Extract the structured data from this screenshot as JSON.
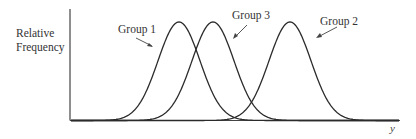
{
  "chart_data": {
    "type": "line",
    "title": "",
    "xlabel": "y",
    "ylabel": "Relative Frequency",
    "grid": false,
    "legend": "inline labels with arrows",
    "axis_ticks": "none",
    "series": [
      {
        "name": "Group 1",
        "center_px": 179,
        "sigma_px": 21,
        "relative_center": 1.0
      },
      {
        "name": "Group 3",
        "center_px": 213,
        "sigma_px": 21,
        "relative_center": 1.4
      },
      {
        "name": "Group 2",
        "center_px": 290,
        "sigma_px": 21,
        "relative_center": 2.3
      }
    ],
    "labels": {
      "group1": "Group 1",
      "group2": "Group 2",
      "group3": "Group 3"
    }
  },
  "axes": {
    "y_label_line1": "Relative",
    "y_label_line2": "Frequency",
    "x_label": "y"
  },
  "style": {
    "curve_color": "#2b2b2b",
    "axis_color": "#444444",
    "background": "#ffffff"
  }
}
